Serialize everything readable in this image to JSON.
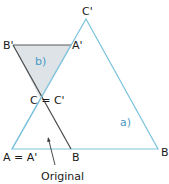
{
  "diagram": {
    "colors": {
      "triangle_a_stroke": "#7cc3dc",
      "triangle_b_fill": "#dde3e7",
      "triangle_b_stroke": "#5a5a5a",
      "original_stroke": "#7cc3dc",
      "label_blue": "#4a9ac4",
      "text": "#1a1a1a"
    },
    "labels": {
      "c_prime_top": "C'",
      "b_prime": "B'",
      "a_prime": "A'",
      "c_eq_c_prime": "C = C'",
      "a_eq_a_prime": "A = A'",
      "b_mid": "B",
      "b_right": "B",
      "triangle_a": "a)",
      "triangle_b": "b)",
      "original": "Original"
    }
  }
}
